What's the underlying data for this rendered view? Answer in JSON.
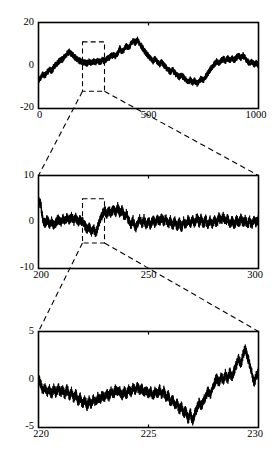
{
  "figure": {
    "title": "",
    "background": "#ffffff",
    "line_color": "#000000",
    "panel_count": 3
  },
  "chart_data": [
    {
      "type": "line",
      "id": "panel-top",
      "title": "",
      "xlabel": "",
      "ylabel": "",
      "xlim": [
        0,
        1000
      ],
      "ylim": [
        -20,
        20
      ],
      "xticks": [
        0,
        500,
        1000
      ],
      "xticklabels": [
        "0",
        "500",
        "1000"
      ],
      "yticks": [
        -20,
        0,
        20
      ],
      "yticklabels": [
        "-20",
        "0",
        "20"
      ],
      "grid": false,
      "legend": null,
      "annotation": {
        "type": "zoom-box",
        "x_range": [
          200,
          300
        ],
        "y_range": [
          -12,
          11
        ]
      },
      "series": [
        {
          "name": "signal",
          "x": [
            0,
            10,
            20,
            30,
            40,
            50,
            60,
            70,
            80,
            90,
            100,
            110,
            120,
            130,
            140,
            150,
            160,
            170,
            180,
            190,
            200,
            210,
            220,
            230,
            240,
            250,
            260,
            270,
            280,
            290,
            300,
            310,
            320,
            330,
            340,
            350,
            360,
            370,
            380,
            390,
            400,
            410,
            420,
            430,
            440,
            450,
            460,
            470,
            480,
            490,
            500,
            510,
            520,
            530,
            540,
            550,
            560,
            570,
            580,
            590,
            600,
            610,
            620,
            630,
            640,
            650,
            660,
            670,
            680,
            690,
            700,
            710,
            720,
            730,
            740,
            750,
            760,
            770,
            780,
            790,
            800,
            810,
            820,
            830,
            840,
            850,
            860,
            870,
            880,
            890,
            900,
            910,
            920,
            930,
            940,
            950,
            960,
            970,
            980,
            990,
            1000
          ],
          "values": [
            -7.0,
            -5.6,
            -4.2,
            -4.6,
            -3.0,
            -2.0,
            -2.6,
            -0.6,
            0.4,
            1.4,
            2.4,
            3.0,
            4.2,
            5.4,
            6.4,
            5.2,
            4.4,
            3.4,
            2.6,
            2.0,
            1.6,
            1.4,
            0.9,
            1.8,
            1.3,
            2.0,
            1.6,
            2.2,
            1.5,
            2.6,
            2.0,
            3.0,
            3.6,
            4.4,
            5.0,
            4.4,
            5.6,
            8.0,
            6.4,
            7.6,
            9.0,
            8.0,
            10.0,
            11.5,
            10.6,
            12.0,
            10.0,
            8.6,
            7.0,
            5.6,
            4.4,
            3.0,
            2.0,
            3.2,
            1.6,
            0.6,
            1.6,
            0.2,
            -1.0,
            -2.0,
            -3.0,
            -2.0,
            -3.6,
            -4.6,
            -5.4,
            -4.4,
            -5.6,
            -6.6,
            -7.6,
            -6.6,
            -8.0,
            -7.0,
            -8.4,
            -7.4,
            -6.0,
            -6.8,
            -5.0,
            -3.6,
            -2.0,
            -0.6,
            0.6,
            2.0,
            1.0,
            2.2,
            3.2,
            2.0,
            3.4,
            2.4,
            3.4,
            2.4,
            3.6,
            4.6,
            3.6,
            4.6,
            3.4,
            2.0,
            0.8,
            1.8,
            0.4,
            1.2,
            0.0
          ],
          "noise_band": 1.6
        }
      ]
    },
    {
      "type": "line",
      "id": "panel-middle",
      "title": "",
      "xlabel": "",
      "ylabel": "",
      "xlim": [
        200,
        300
      ],
      "ylim": [
        -10,
        10
      ],
      "xticks": [
        200,
        250,
        300
      ],
      "xticklabels": [
        "200",
        "250",
        "300"
      ],
      "yticks": [
        -10,
        0,
        10
      ],
      "yticklabels": [
        "-10",
        "0",
        "10"
      ],
      "grid": false,
      "legend": null,
      "annotation": {
        "type": "zoom-box",
        "x_range": [
          220,
          230
        ],
        "y_range": [
          -4.5,
          5.0
        ]
      },
      "series": [
        {
          "name": "signal",
          "x": [
            200,
            201,
            202,
            203,
            204,
            205,
            206,
            207,
            208,
            209,
            210,
            211,
            212,
            213,
            214,
            215,
            216,
            217,
            218,
            219,
            220,
            221,
            222,
            223,
            224,
            225,
            226,
            227,
            228,
            229,
            230,
            231,
            232,
            233,
            234,
            235,
            236,
            237,
            238,
            239,
            240,
            241,
            242,
            243,
            244,
            245,
            246,
            247,
            248,
            249,
            250,
            251,
            252,
            253,
            254,
            255,
            256,
            257,
            258,
            259,
            260,
            261,
            262,
            263,
            264,
            265,
            266,
            267,
            268,
            269,
            270,
            271,
            272,
            273,
            274,
            275,
            276,
            277,
            278,
            279,
            280,
            281,
            282,
            283,
            284,
            285,
            286,
            287,
            288,
            289,
            290,
            291,
            292,
            293,
            294,
            295,
            296,
            297,
            298,
            299,
            300
          ],
          "values": [
            4.6,
            3.8,
            0.4,
            -0.4,
            0.6,
            -0.6,
            0.2,
            -0.8,
            0.0,
            0.6,
            -0.2,
            0.8,
            0.2,
            1.0,
            0.4,
            1.2,
            0.2,
            1.0,
            0.0,
            0.6,
            0.0,
            -0.6,
            -1.6,
            -1.0,
            -2.2,
            -1.4,
            -2.6,
            -1.0,
            0.6,
            1.6,
            2.6,
            1.6,
            2.6,
            1.8,
            3.0,
            2.0,
            3.2,
            1.8,
            2.6,
            1.0,
            1.8,
            0.4,
            -0.8,
            0.4,
            -1.4,
            -0.4,
            0.8,
            -0.6,
            0.6,
            -0.8,
            0.4,
            -0.8,
            0.6,
            -0.4,
            0.8,
            0.0,
            1.0,
            0.0,
            0.8,
            -0.6,
            0.4,
            -0.8,
            0.2,
            -1.0,
            0.0,
            -1.2,
            0.2,
            -0.8,
            0.6,
            -0.6,
            0.8,
            -0.4,
            1.0,
            -0.2,
            0.8,
            -0.6,
            0.6,
            -0.8,
            0.4,
            -0.6,
            0.6,
            -0.4,
            1.0,
            0.2,
            1.2,
            0.0,
            0.8,
            -0.6,
            0.4,
            -0.8,
            0.6,
            -0.4,
            0.8,
            -0.2,
            0.6,
            -0.6,
            0.4,
            -0.8,
            0.6,
            -0.2,
            0.6
          ],
          "noise_band": 1.1
        }
      ]
    },
    {
      "type": "line",
      "id": "panel-bottom",
      "title": "",
      "xlabel": "",
      "ylabel": "",
      "xlim": [
        220,
        230
      ],
      "ylim": [
        -5,
        5
      ],
      "xticks": [
        220,
        225,
        230
      ],
      "xticklabels": [
        "220",
        "225",
        "230"
      ],
      "yticks": [
        -5,
        0,
        5
      ],
      "yticklabels": [
        "-5",
        "0",
        "5"
      ],
      "grid": false,
      "legend": null,
      "annotation": null,
      "series": [
        {
          "name": "signal",
          "x": [
            220.0,
            220.1,
            220.2,
            220.3,
            220.4,
            220.5,
            220.6,
            220.7,
            220.8,
            220.9,
            221.0,
            221.1,
            221.2,
            221.3,
            221.4,
            221.5,
            221.6,
            221.7,
            221.8,
            221.9,
            222.0,
            222.1,
            222.2,
            222.3,
            222.4,
            222.5,
            222.6,
            222.7,
            222.8,
            222.9,
            223.0,
            223.1,
            223.2,
            223.3,
            223.4,
            223.5,
            223.6,
            223.7,
            223.8,
            223.9,
            224.0,
            224.1,
            224.2,
            224.3,
            224.4,
            224.5,
            224.6,
            224.7,
            224.8,
            224.9,
            225.0,
            225.1,
            225.2,
            225.3,
            225.4,
            225.5,
            225.6,
            225.7,
            225.8,
            225.9,
            226.0,
            226.1,
            226.2,
            226.3,
            226.4,
            226.5,
            226.6,
            226.7,
            226.8,
            226.9,
            227.0,
            227.1,
            227.2,
            227.3,
            227.4,
            227.5,
            227.6,
            227.7,
            227.8,
            227.9,
            228.0,
            228.1,
            228.2,
            228.3,
            228.4,
            228.5,
            228.6,
            228.7,
            228.8,
            228.9,
            229.0,
            229.1,
            229.2,
            229.3,
            229.4,
            229.5,
            229.6,
            229.7,
            229.8,
            229.9,
            230.0
          ],
          "values": [
            0.1,
            -0.5,
            -1.2,
            -0.8,
            -1.4,
            -1.0,
            -1.6,
            -0.9,
            -1.5,
            -0.8,
            -1.4,
            -1.0,
            -1.6,
            -0.9,
            -1.8,
            -1.2,
            -2.0,
            -1.4,
            -2.4,
            -1.8,
            -2.6,
            -2.0,
            -2.8,
            -2.2,
            -2.6,
            -2.0,
            -2.4,
            -1.8,
            -2.2,
            -1.6,
            -2.0,
            -1.4,
            -1.8,
            -1.2,
            -1.6,
            -1.0,
            -1.4,
            -1.2,
            -1.8,
            -1.2,
            -1.6,
            -1.0,
            -1.4,
            -0.8,
            -1.2,
            -0.7,
            -1.3,
            -0.9,
            -1.5,
            -1.0,
            -1.6,
            -1.2,
            -1.8,
            -1.2,
            -1.6,
            -1.0,
            -1.6,
            -1.2,
            -2.0,
            -1.6,
            -2.4,
            -2.0,
            -2.8,
            -2.4,
            -3.2,
            -2.8,
            -3.6,
            -3.2,
            -4.2,
            -3.4,
            -4.4,
            -3.6,
            -3.0,
            -2.4,
            -2.8,
            -2.2,
            -1.8,
            -1.2,
            -1.6,
            -1.0,
            -0.4,
            0.2,
            -0.4,
            0.4,
            -0.2,
            0.6,
            0.0,
            0.8,
            0.2,
            1.0,
            1.6,
            2.2,
            1.6,
            2.6,
            3.2,
            2.4,
            1.6,
            0.6,
            -0.4,
            0.4,
            0.8
          ],
          "noise_band": 0.55
        }
      ]
    }
  ],
  "connectors": [
    {
      "name": "top-to-middle",
      "from_panel": "panel-top",
      "to_panel": "panel-middle",
      "style": "dashed"
    },
    {
      "name": "middle-to-bottom",
      "from_panel": "panel-middle",
      "to_panel": "panel-bottom",
      "style": "dashed"
    }
  ]
}
